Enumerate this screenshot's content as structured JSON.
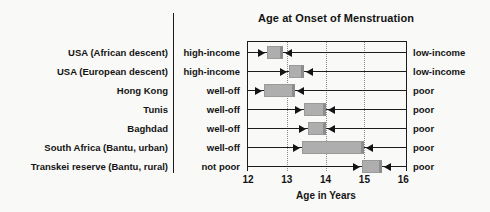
{
  "title": "Age at Onset of Menstruation",
  "axis": {
    "label": "Age in Years",
    "ticks": [
      "12",
      "13",
      "14",
      "15",
      "16"
    ],
    "tick_values": [
      12,
      13,
      14,
      15,
      16
    ],
    "min": 12,
    "max": 16,
    "gridlines": [
      13,
      14,
      15
    ]
  },
  "rows": [
    {
      "country": "USA (African descent)",
      "status_left": "high-income",
      "status_right": "low-income",
      "onset_range_years": [
        12.5,
        12.9
      ]
    },
    {
      "country": "USA (European descent)",
      "status_left": "high-income",
      "status_right": "low-income",
      "onset_range_years": [
        13.05,
        13.45
      ]
    },
    {
      "country": "Hong Kong",
      "status_left": "well-off",
      "status_right": "poor",
      "onset_range_years": [
        12.4,
        13.2
      ]
    },
    {
      "country": "Tunis",
      "status_left": "well-off",
      "status_right": "poor",
      "onset_range_years": [
        13.45,
        14.0
      ]
    },
    {
      "country": "Baghdad",
      "status_left": "well-off",
      "status_right": "poor",
      "onset_range_years": [
        13.55,
        14.0
      ]
    },
    {
      "country": "South Africa (Bantu, urban)",
      "status_left": "well-off",
      "status_right": "poor",
      "onset_range_years": [
        13.4,
        15.0
      ]
    },
    {
      "country": "Transkei reserve (Bantu, rural)",
      "status_left": "not poor",
      "status_right": "poor",
      "onset_range_years": [
        14.95,
        15.45
      ]
    }
  ],
  "chart_data": {
    "type": "range-bar",
    "title": "Age at Onset of Menstruation",
    "xlabel": "Age in Years",
    "xlim": [
      12,
      16
    ],
    "x_ticks": [
      12,
      13,
      14,
      15,
      16
    ],
    "gridlines_at": [
      13,
      14,
      15
    ],
    "grid_style": "dotted-vertical",
    "categories": [
      "USA (African descent)",
      "USA (European descent)",
      "Hong Kong",
      "Tunis",
      "Baghdad",
      "South Africa (Bantu, urban)",
      "Transkei reserve (Bantu, rural)"
    ],
    "series": [
      {
        "name": "affluent-group onset age (left edge of box)",
        "values": [
          12.5,
          13.05,
          12.4,
          13.45,
          13.55,
          13.4,
          14.95
        ]
      },
      {
        "name": "poor-group onset age (right edge of box)",
        "values": [
          12.9,
          13.45,
          13.2,
          14.0,
          14.0,
          15.0,
          15.45
        ]
      }
    ],
    "left_group_labels": [
      "high-income",
      "high-income",
      "well-off",
      "well-off",
      "well-off",
      "well-off",
      "not poor"
    ],
    "right_group_labels": [
      "low-income",
      "low-income",
      "poor",
      "poor",
      "poor",
      "poor",
      "poor"
    ],
    "annotation_style": "arrows point inward from both line ends toward shaded range box"
  },
  "colors": {
    "background": "#f9f9f7",
    "text": "#141414",
    "line": "#1c1c1c",
    "box_fill": "#aeaeae",
    "box_edge": "#8c8c8c",
    "gridline": "#8a8a8a"
  }
}
